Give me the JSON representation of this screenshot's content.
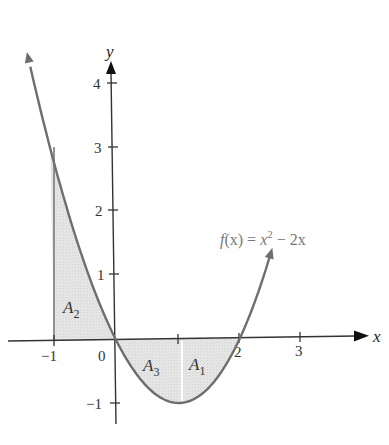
{
  "chart_data": {
    "type": "area",
    "title": "",
    "function_label": "f(x) = x^2 - 2x",
    "function": {
      "expression": "x^2 - 2x",
      "name": "f(x)",
      "label_parts": {
        "lhs": "f",
        "arg": "(x)",
        "eq": " = ",
        "base": "x",
        "exp": "2",
        "rest": " − 2x"
      }
    },
    "xlabel": "x",
    "ylabel": "y",
    "xlim": [
      -1.3,
      3.8
    ],
    "ylim": [
      -1.3,
      4.4
    ],
    "x_ticks": [
      -1,
      0,
      1,
      2,
      3
    ],
    "x_tick_labels": [
      "−1",
      "0",
      "",
      "2",
      "3"
    ],
    "y_ticks": [
      -1,
      1,
      2,
      3,
      4
    ],
    "y_tick_labels": [
      "−1",
      "1",
      "2",
      "3",
      "4"
    ],
    "grid": false,
    "curve_domain": [
      -1.35,
      2.55
    ],
    "shaded_regions": [
      {
        "name": "A2",
        "label": "A",
        "sub": "2",
        "x_range": [
          -1,
          0
        ],
        "sign": "positive"
      },
      {
        "name": "A3",
        "label": "A",
        "sub": "3",
        "x_range": [
          0,
          1
        ],
        "sign": "negative"
      },
      {
        "name": "A1",
        "label": "A",
        "sub": "1",
        "x_range": [
          1,
          2
        ],
        "sign": "negative"
      }
    ],
    "key_points": [
      {
        "x": -1,
        "y": 3
      },
      {
        "x": 0,
        "y": 0
      },
      {
        "x": 1,
        "y": -1
      },
      {
        "x": 2,
        "y": 0
      }
    ],
    "colors": {
      "curve": "#6e6e6e",
      "fill": "#e3e3e3",
      "axis": "#333333"
    }
  }
}
